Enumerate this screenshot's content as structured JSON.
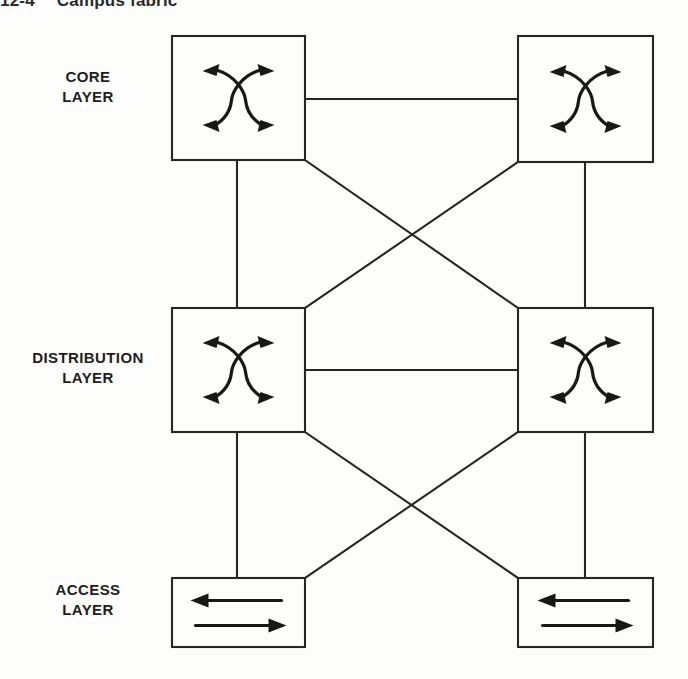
{
  "figure": {
    "number": "12-4",
    "caption": "Campus fabric",
    "background_color": "#fdfdfb",
    "line_color": "#262626"
  },
  "layers": [
    {
      "id": "core",
      "label_line1": "CORE",
      "label_line2": "LAYER"
    },
    {
      "id": "distribution",
      "label_line1": "DISTRIBUTION",
      "label_line2": "LAYER"
    },
    {
      "id": "access",
      "label_line1": "ACCESS",
      "label_line2": "LAYER"
    }
  ],
  "nodes": [
    {
      "id": "core-left",
      "layer": "core",
      "icon": "multilayer-switch-icon",
      "x": 172,
      "y": 36,
      "w": 133,
      "h": 124
    },
    {
      "id": "core-right",
      "layer": "core",
      "icon": "multilayer-switch-icon",
      "x": 518,
      "y": 36,
      "w": 135,
      "h": 126
    },
    {
      "id": "distribution-left",
      "layer": "distribution",
      "icon": "multilayer-switch-icon",
      "x": 172,
      "y": 308,
      "w": 133,
      "h": 124
    },
    {
      "id": "distribution-right",
      "layer": "distribution",
      "icon": "multilayer-switch-icon",
      "x": 518,
      "y": 308,
      "w": 135,
      "h": 124
    },
    {
      "id": "access-left",
      "layer": "access",
      "icon": "layer2-switch-icon",
      "x": 172,
      "y": 578,
      "w": 133,
      "h": 69
    },
    {
      "id": "access-right",
      "layer": "access",
      "icon": "layer2-switch-icon",
      "x": 518,
      "y": 578,
      "w": 135,
      "h": 69
    }
  ],
  "links": [
    {
      "id": "core-horizontal",
      "from": "core-left",
      "to": "core-right",
      "kind": "horizontal",
      "x1": 305,
      "y1": 99,
      "x2": 518,
      "y2": 99
    },
    {
      "id": "distribution-horizontal",
      "from": "distribution-left",
      "to": "distribution-right",
      "kind": "horizontal",
      "x1": 305,
      "y1": 370,
      "x2": 518,
      "y2": 370
    },
    {
      "id": "core-left-to-dist-left",
      "from": "core-left",
      "to": "distribution-left",
      "kind": "vertical",
      "x1": 237,
      "y1": 160,
      "x2": 237,
      "y2": 308
    },
    {
      "id": "core-right-to-dist-right",
      "from": "core-right",
      "to": "distribution-right",
      "kind": "vertical",
      "x1": 585,
      "y1": 162,
      "x2": 585,
      "y2": 308
    },
    {
      "id": "core-left-to-dist-right",
      "from": "core-left",
      "to": "distribution-right",
      "kind": "diagonal",
      "x1": 305,
      "y1": 160,
      "x2": 518,
      "y2": 308
    },
    {
      "id": "core-right-to-dist-left",
      "from": "core-right",
      "to": "distribution-left",
      "kind": "diagonal",
      "x1": 518,
      "y1": 162,
      "x2": 305,
      "y2": 308
    },
    {
      "id": "dist-left-to-access-left",
      "from": "distribution-left",
      "to": "access-left",
      "kind": "vertical",
      "x1": 237,
      "y1": 432,
      "x2": 237,
      "y2": 578
    },
    {
      "id": "dist-right-to-access-right",
      "from": "distribution-right",
      "to": "access-right",
      "kind": "vertical",
      "x1": 585,
      "y1": 432,
      "x2": 585,
      "y2": 578
    },
    {
      "id": "dist-left-to-access-right",
      "from": "distribution-left",
      "to": "access-right",
      "kind": "diagonal",
      "x1": 305,
      "y1": 432,
      "x2": 518,
      "y2": 578
    },
    {
      "id": "dist-right-to-access-left",
      "from": "distribution-right",
      "to": "access-left",
      "kind": "diagonal",
      "x1": 518,
      "y1": 432,
      "x2": 305,
      "y2": 578
    }
  ]
}
